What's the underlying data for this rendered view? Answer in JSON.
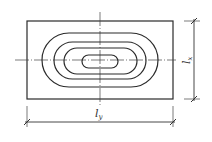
{
  "diagram": {
    "type": "plate contour diagram",
    "labels": {
      "vertical_dimension": {
        "base": "l",
        "sub": "x"
      },
      "horizontal_dimension": {
        "base": "l",
        "sub": "y"
      }
    },
    "contours": 4,
    "colors": {
      "stroke": "#2a2a2a",
      "background": "#ffffff"
    }
  }
}
